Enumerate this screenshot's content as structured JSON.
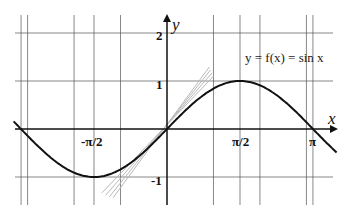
{
  "chart_data": {
    "type": "line",
    "title": "",
    "function_label": "y = f(x) = sin x",
    "xlabel": "x",
    "ylabel": "y",
    "x_ticks": [
      {
        "value": -1.5708,
        "label": "-π/2"
      },
      {
        "value": 1.5708,
        "label": "π/2"
      },
      {
        "value": 3.1416,
        "label": "π"
      }
    ],
    "y_ticks": [
      {
        "value": 2,
        "label": "2"
      },
      {
        "value": 1,
        "label": "1"
      },
      {
        "value": -1,
        "label": "-1"
      }
    ],
    "xlim": [
      -3.3,
      3.65
    ],
    "ylim": [
      -1.6,
      2.4
    ],
    "grid": true,
    "grid_x_values": [
      -3.14,
      -3.0,
      -2.0,
      -1.5708,
      -1.0,
      1.0,
      1.5708,
      2.0,
      3.0,
      3.14
    ],
    "grid_y_values": [
      2,
      1,
      -1
    ],
    "series": [
      {
        "name": "sin x",
        "color": "#111111",
        "x_range": [
          -3.3,
          3.65
        ],
        "function": "sin"
      },
      {
        "name": "tangent/secant lines near origin",
        "color": "#bbbbbb",
        "slopes": [
          1.0,
          1.1,
          1.2,
          1.3
        ],
        "through": [
          0,
          0
        ]
      }
    ]
  },
  "labels": {
    "function": "y = f(x) = sin x",
    "x_axis": "x",
    "y_axis": "y",
    "tick_neg_pi_half": "-π/2",
    "tick_pi_half": "π/2",
    "tick_pi": "π",
    "tick_y2": "2",
    "tick_y1": "1",
    "tick_yneg1": "-1"
  }
}
